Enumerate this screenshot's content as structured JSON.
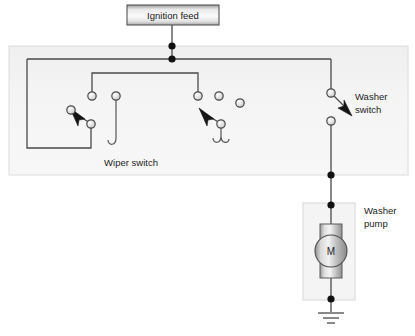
{
  "diagram": {
    "background_color": "#ffffff",
    "wire_color": "#4a4a4a",
    "panel_color": "#f2f2f2",
    "node_color": "#111111"
  },
  "ignition_feed": {
    "label": "Ignition feed",
    "box": {
      "x": 127,
      "y": 5,
      "w": 92,
      "h": 20
    }
  },
  "wiper_switch": {
    "label": "Wiper switch",
    "panel": {
      "x": 9,
      "y": 46,
      "w": 399,
      "h": 129
    },
    "label_pos": {
      "x": 131,
      "y": 163
    },
    "terminals": [
      {
        "name": "upper-left-pole",
        "x": 92,
        "y": 96
      },
      {
        "name": "left-blade-pivot",
        "x": 71,
        "y": 110
      },
      {
        "name": "left-lower-contact",
        "x": 91,
        "y": 124
      },
      {
        "name": "centre-park-terminal",
        "x": 116,
        "y": 96
      },
      {
        "name": "right-blade-pivot",
        "x": 200,
        "y": 110
      },
      {
        "name": "right-upper-pole",
        "x": 198,
        "y": 96
      },
      {
        "name": "right-lower-contact",
        "x": 221,
        "y": 124
      },
      {
        "name": "spare-terminal-a",
        "x": 219,
        "y": 96
      },
      {
        "name": "spare-terminal-b",
        "x": 240,
        "y": 103
      }
    ]
  },
  "washer_switch": {
    "label_line1": "Washer",
    "label_line2": "switch",
    "label_pos": {
      "x": 355,
      "y": 100
    },
    "upper_terminal": {
      "x": 331,
      "y": 93
    },
    "lower_terminal": {
      "x": 331,
      "y": 121
    },
    "state": "open"
  },
  "washer_pump": {
    "label_line1": "Washer",
    "label_line2": "pump",
    "label_pos": {
      "x": 365,
      "y": 211
    },
    "box": {
      "x": 303,
      "y": 203,
      "w": 52,
      "h": 97
    },
    "motor_symbol": "M",
    "motor_center": {
      "x": 331,
      "y": 251
    },
    "motor_radius": 16
  },
  "ground": {
    "name": "chassis-ground",
    "x": 331,
    "y": 312,
    "bar_widths": [
      26,
      16,
      8
    ]
  },
  "junctions": [
    {
      "name": "feed-panel-entry-node",
      "x": 172,
      "y": 46
    },
    {
      "name": "feed-bus-node",
      "x": 172,
      "y": 59
    },
    {
      "name": "washer-panel-exit-node",
      "x": 331,
      "y": 175
    },
    {
      "name": "pump-top-node",
      "x": 331,
      "y": 205
    },
    {
      "name": "pump-bottom-node",
      "x": 331,
      "y": 299
    }
  ]
}
